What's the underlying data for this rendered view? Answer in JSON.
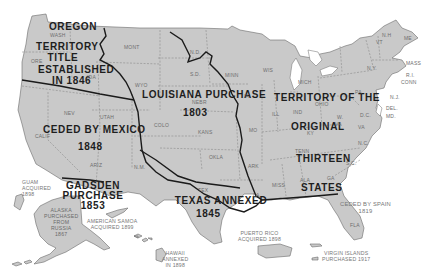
{
  "map": {
    "title": "US territorial acquisitions",
    "colors": {
      "land": "#c9c9c9",
      "boundary": "#1a1a1a",
      "state_border": "#7c7c7c",
      "background": "#ffffff"
    },
    "regions": {
      "oregon": {
        "line1": "OREGON",
        "line2": "TERRITORY",
        "line3": "TITLE",
        "line4": "ESTABLISHED",
        "line5": "IN 1846"
      },
      "louisiana": {
        "line1": "LOUISIANA PURCHASE",
        "line2": "1803"
      },
      "mexico": {
        "line1": "CEDED BY MEXICO",
        "line2": "1848"
      },
      "gadsden": {
        "line1": "GADSDEN",
        "line2": "PURCHASE",
        "line3": "1853"
      },
      "texas": {
        "line1": "TEXAS ANNEXED",
        "line2": "1845"
      },
      "original": {
        "line1": "TERRITORY OF THE",
        "line2": "ORIGINAL",
        "line3": "THIRTEEN",
        "line4": "STATES"
      },
      "spain": {
        "line1": "CEDED BY SPAIN",
        "line2": "1819"
      }
    },
    "territories": {
      "guam": {
        "line1": "GUAM",
        "line2": "ACQUIRED",
        "line3": "1898"
      },
      "alaska": {
        "line1": "ALASKA",
        "line2": "PURCHASED",
        "line3": "FROM",
        "line4": "RUSSIA",
        "line5": "1867"
      },
      "samoa": {
        "line1": "AMERICAN SAMOA",
        "line2": "ACQUIRED 1899"
      },
      "hawaii": {
        "line1": "HAWAII",
        "line2": "ANNEXED",
        "line3": "IN 1898"
      },
      "puerto_rico": {
        "line1": "PUERTO RICO",
        "line2": "ACQUIRED 1898"
      },
      "virgin_islands": {
        "line1": "VIRGIN ISLANDS",
        "line2": "PURCHASED 1917"
      }
    },
    "states": {
      "wash": "WASH",
      "ore": "ORE",
      "ida": "IDA",
      "mont": "MONT",
      "wyo": "WYO",
      "nd": "N.D.",
      "sd": "S.D.",
      "nebr": "NEBR",
      "minn": "MINN",
      "ia": "IA",
      "wis": "WIS",
      "mich": "MICH",
      "nev": "NEV",
      "utah": "UTAH",
      "calif": "CALIF",
      "colo": "COLO",
      "kans": "KANS",
      "mo": "MO",
      "ill": "ILL",
      "ind": "IND",
      "ohio": "OHIO",
      "pa": "PA",
      "ny": "N.Y.",
      "vt": "VT",
      "nh": "N.H",
      "me": "ME",
      "mass": "MASS",
      "ri": "R.I.",
      "conn": "CONN",
      "nj": "N.J.",
      "del": "DEL.",
      "md": "MD.",
      "wva": "W.",
      "wva2": "VA",
      "va": "VA",
      "dc": "D.C.",
      "ky": "KY",
      "tenn": "TENN",
      "nc": "N.C.",
      "sc": "S.C.",
      "arize": "ARIZ",
      "nm": "N.M.",
      "okla": "OKLA",
      "ark": "ARK",
      "tex": "TEX",
      "la": "LA",
      "miss": "MISS",
      "ala": "ALA",
      "ga": "GA",
      "fla": "FLA"
    }
  }
}
